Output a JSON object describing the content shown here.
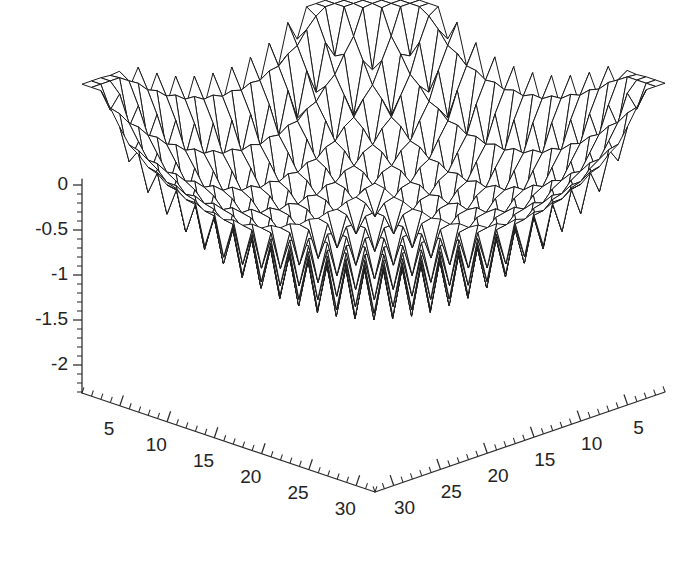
{
  "chart_data": {
    "type": "surface",
    "title": "",
    "xlabel": "",
    "ylabel": "",
    "zlabel": "",
    "grid": false,
    "legend": null,
    "projection": "3d-wireframe",
    "mesh": {
      "nx": 32,
      "ny": 32,
      "line_color": "#1a1a1a",
      "face_color": "#ffffff"
    },
    "background_color": "#ffffff",
    "axis_color": "#2b2b2b",
    "x_axis": {
      "name": "left-horizontal-axis",
      "ticks": [
        5,
        10,
        15,
        20,
        25,
        30
      ],
      "tick_labels": [
        "5",
        "10",
        "15",
        "20",
        "25",
        "30"
      ],
      "range": [
        1,
        32
      ],
      "minor_tick_step": 1,
      "major_tick_step": 5
    },
    "y_axis": {
      "name": "right-horizontal-axis",
      "ticks": [
        30,
        25,
        20,
        15,
        10,
        5
      ],
      "tick_labels": [
        "30",
        "25",
        "20",
        "15",
        "10",
        "5"
      ],
      "range": [
        1,
        32
      ],
      "minor_tick_step": 1,
      "major_tick_step": 5
    },
    "z_axis": {
      "name": "vertical-axis",
      "ticks": [
        0,
        -0.5,
        -1,
        -1.5,
        -2
      ],
      "tick_labels": [
        "0",
        "-0.5",
        "-1",
        "-1.5",
        "-2"
      ],
      "range": [
        -2.35,
        0.05
      ],
      "minor_tick_step": 0.1,
      "major_tick_step": 0.5
    },
    "surface_description": "Bowl-shaped multimodal wireframe surface with dense local oscillations; sharp peak at the far corner rising to z=0, corner ridges rising at left and right edges, minimum near z=-2.3 at the front center.",
    "z_min": -2.3,
    "z_max": 0.0
  },
  "axis_labels": {
    "z": [
      "0",
      "-0.5",
      "-1",
      "-1.5",
      "-2"
    ],
    "x_left": [
      "5",
      "10",
      "15",
      "20",
      "25",
      "30"
    ],
    "y_right": [
      "30",
      "25",
      "20",
      "15",
      "10",
      "5"
    ]
  }
}
